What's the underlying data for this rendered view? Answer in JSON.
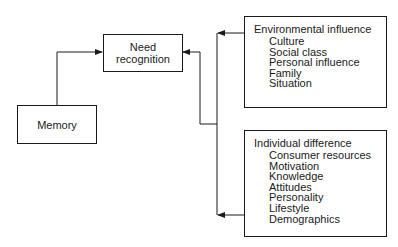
{
  "diagram": {
    "nodes": {
      "need_recognition": {
        "line1": "Need",
        "line2": "recognition"
      },
      "memory": {
        "label": "Memory"
      },
      "environmental_influence": {
        "title": "Environmental influence",
        "items": [
          "Culture",
          "Social class",
          "Personal influence",
          "Family",
          "Situation"
        ]
      },
      "individual_difference": {
        "title": "Individual difference",
        "items": [
          "Consumer resources",
          "Motivation",
          "Knowledge",
          "Attitudes",
          "Personality",
          "Lifestyle",
          "Demographics"
        ]
      }
    },
    "edges": [
      {
        "from": "Memory",
        "to": "Need recognition"
      },
      {
        "from": "Environmental influence",
        "to": "Need recognition"
      },
      {
        "from": "Individual difference",
        "to": "Need recognition"
      }
    ],
    "colors": {
      "line": "#1a1a1a",
      "background": "#ffffff"
    }
  }
}
